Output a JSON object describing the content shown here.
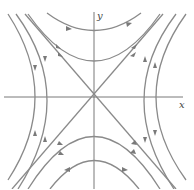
{
  "diagram": {
    "type": "phase-portrait",
    "axes": {
      "x_label": "x",
      "y_label": "y"
    },
    "colors": {
      "axis": "#6a6a6a",
      "trajectory": "#8a8a8a",
      "arrow": "#7a7a7a",
      "background": "#ffffff"
    }
  }
}
